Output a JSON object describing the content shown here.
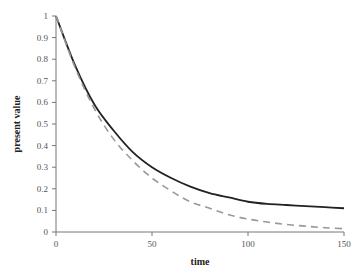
{
  "chart_data": {
    "type": "line",
    "title": "",
    "xlabel": "time",
    "ylabel": "present value",
    "xlim": [
      0,
      150
    ],
    "ylim": [
      0,
      1
    ],
    "xticks": [
      0,
      50,
      100,
      150
    ],
    "yticks": [
      0,
      0.1,
      0.2,
      0.3,
      0.4,
      0.5,
      0.6,
      0.7,
      0.8,
      0.9,
      1
    ],
    "grid": false,
    "legend": null,
    "x": [
      0,
      10,
      20,
      30,
      40,
      50,
      60,
      70,
      80,
      90,
      100,
      110,
      120,
      130,
      140,
      150
    ],
    "series": [
      {
        "name": "solid",
        "style": "solid",
        "color": "#222222",
        "values": [
          1.0,
          0.77,
          0.59,
          0.47,
          0.37,
          0.3,
          0.25,
          0.21,
          0.18,
          0.16,
          0.14,
          0.13,
          0.125,
          0.12,
          0.115,
          0.11
        ]
      },
      {
        "name": "dashed",
        "style": "dashed",
        "color": "#999999",
        "values": [
          1.0,
          0.76,
          0.57,
          0.43,
          0.33,
          0.25,
          0.19,
          0.14,
          0.11,
          0.08,
          0.06,
          0.046,
          0.035,
          0.027,
          0.02,
          0.015
        ]
      }
    ]
  },
  "axis": {
    "x_title": "time",
    "y_title": "present value"
  },
  "footer_text": "· · · · · · · · · ·"
}
